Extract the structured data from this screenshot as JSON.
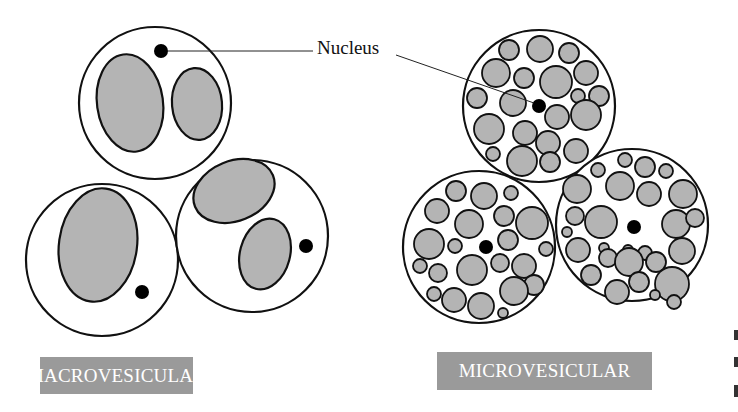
{
  "figure": {
    "callout_label": "Nucleus",
    "panels": [
      {
        "id": "macro",
        "label": "MACROVESICULAR"
      },
      {
        "id": "micro",
        "label": "MICROVESICULAR"
      }
    ]
  },
  "colors": {
    "vesicle_fill": "#b4b4b4",
    "outline": "#111111",
    "nucleus": "#000000",
    "label_bg": "#9a9a9a",
    "label_text": "#ffffff"
  },
  "macro_cells": [
    {
      "cx": 155,
      "cy": 103,
      "r": 76,
      "nucleus": {
        "cx": 161,
        "cy": 51,
        "r": 7
      },
      "vesicles": [
        {
          "cx": 130,
          "cy": 103,
          "rx": 33,
          "ry": 49,
          "rot": -8
        },
        {
          "cx": 197,
          "cy": 104,
          "rx": 25,
          "ry": 36,
          "rot": -5
        }
      ]
    },
    {
      "cx": 102,
      "cy": 260,
      "r": 76,
      "nucleus": {
        "cx": 142,
        "cy": 292,
        "r": 7
      },
      "vesicles": [
        {
          "cx": 98,
          "cy": 245,
          "rx": 39,
          "ry": 57,
          "rot": 8
        }
      ]
    },
    {
      "cx": 252,
      "cy": 236,
      "r": 76,
      "nucleus": {
        "cx": 306,
        "cy": 246,
        "r": 7
      },
      "vesicles": [
        {
          "cx": 234,
          "cy": 191,
          "rx": 42,
          "ry": 30,
          "rot": -22
        },
        {
          "cx": 265,
          "cy": 254,
          "rx": 25,
          "ry": 36,
          "rot": 15
        }
      ]
    }
  ],
  "micro_cells": [
    {
      "cx": 539,
      "cy": 106,
      "r": 76,
      "nucleus": {
        "cx": 539,
        "cy": 106,
        "r": 7
      },
      "vesicles": [
        [
          509,
          50,
          10
        ],
        [
          540,
          49,
          13
        ],
        [
          569,
          53,
          10
        ],
        [
          496,
          73,
          14
        ],
        [
          524,
          78,
          10
        ],
        [
          556,
          82,
          16
        ],
        [
          586,
          73,
          12
        ],
        [
          477,
          98,
          10
        ],
        [
          513,
          103,
          13
        ],
        [
          578,
          96,
          7
        ],
        [
          599,
          96,
          10
        ],
        [
          557,
          117,
          12
        ],
        [
          586,
          115,
          15
        ],
        [
          489,
          129,
          15
        ],
        [
          525,
          133,
          12
        ],
        [
          548,
          143,
          12
        ],
        [
          576,
          151,
          12
        ],
        [
          493,
          154,
          7
        ],
        [
          522,
          161,
          15
        ],
        [
          550,
          162,
          10
        ]
      ]
    },
    {
      "cx": 479,
      "cy": 247,
      "r": 76,
      "nucleus": {
        "cx": 486,
        "cy": 247,
        "r": 7
      },
      "vesicles": [
        [
          456,
          191,
          10
        ],
        [
          484,
          196,
          13
        ],
        [
          511,
          193,
          7
        ],
        [
          437,
          211,
          12
        ],
        [
          469,
          224,
          14
        ],
        [
          504,
          216,
          10
        ],
        [
          532,
          223,
          16
        ],
        [
          429,
          244,
          15
        ],
        [
          455,
          246,
          7
        ],
        [
          508,
          240,
          10
        ],
        [
          546,
          249,
          7
        ],
        [
          420,
          266,
          7
        ],
        [
          438,
          273,
          9
        ],
        [
          472,
          270,
          15
        ],
        [
          500,
          263,
          9
        ],
        [
          524,
          266,
          12
        ],
        [
          534,
          285,
          10
        ],
        [
          434,
          294,
          7
        ],
        [
          454,
          300,
          12
        ],
        [
          481,
          306,
          13
        ],
        [
          514,
          291,
          14
        ],
        [
          503,
          313,
          5
        ]
      ]
    },
    {
      "cx": 632,
      "cy": 225,
      "r": 76,
      "nucleus": {
        "cx": 634,
        "cy": 227,
        "r": 7
      },
      "vesicles": [
        [
          625,
          160,
          7
        ],
        [
          645,
          167,
          10
        ],
        [
          666,
          171,
          7
        ],
        [
          598,
          170,
          7
        ],
        [
          577,
          189,
          14
        ],
        [
          620,
          186,
          14
        ],
        [
          649,
          194,
          12
        ],
        [
          683,
          194,
          14
        ],
        [
          575,
          216,
          9
        ],
        [
          567,
          232,
          5
        ],
        [
          601,
          222,
          16
        ],
        [
          676,
          224,
          14
        ],
        [
          695,
          218,
          9
        ],
        [
          604,
          248,
          5
        ],
        [
          628,
          250,
          5
        ],
        [
          645,
          253,
          7
        ],
        [
          656,
          262,
          10
        ],
        [
          578,
          250,
          12
        ],
        [
          608,
          258,
          9
        ],
        [
          629,
          262,
          14
        ],
        [
          682,
          251,
          13
        ],
        [
          591,
          275,
          10
        ],
        [
          617,
          292,
          12
        ],
        [
          639,
          282,
          10
        ],
        [
          672,
          284,
          17
        ],
        [
          674,
          302,
          7
        ],
        [
          655,
          295,
          5
        ]
      ]
    }
  ],
  "callout_lines": [
    {
      "x1": 168,
      "y1": 51,
      "x2": 313,
      "y2": 51
    },
    {
      "x1": 396,
      "y1": 55,
      "x2": 534,
      "y2": 103
    }
  ]
}
